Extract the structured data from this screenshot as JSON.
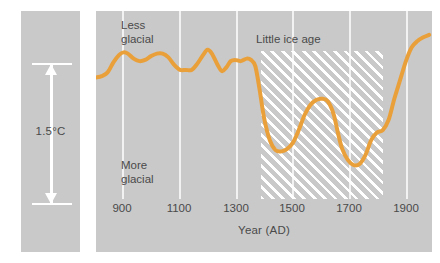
{
  "figure": {
    "background_color": "#ffffff",
    "panel_color": "#c9c9c9",
    "gridline_color": "#f2f2f2",
    "text_color": "#4a4a4a"
  },
  "scale": {
    "label": "1.5°C",
    "arrow_name": "vertical-scale-arrow",
    "arrow_color": "#ffffff"
  },
  "annotations": {
    "less_glacial": "Less\nglacial",
    "more_glacial": "More\nglacial",
    "little_ice_age": "Little ice age"
  },
  "axis": {
    "title": "Year (AD)",
    "ticks": [
      900,
      1100,
      1300,
      1500,
      1700,
      1900
    ],
    "tick_labels": [
      "900",
      "1100",
      "1300",
      "1500",
      "1700",
      "1900"
    ]
  },
  "chart_data": {
    "type": "line",
    "title": "",
    "subtitle": "",
    "xlabel": "Year (AD)",
    "ylabel": "",
    "xlim": [
      820,
      1980
    ],
    "ylim": [
      -1.05,
      0.45
    ],
    "grid": true,
    "legend": null,
    "line_color": "#e9a03b",
    "line_width_px": 4,
    "y_units": "relative temperature (°C), scale bar = 1.5°C",
    "y_direction_note": "up = Less glacial, down = More glacial",
    "shaded_region": {
      "label": "Little ice age",
      "x_start": 1390,
      "x_end": 1810,
      "fill": "white-diagonal-hatch"
    },
    "annotations": [
      {
        "text": "Less glacial",
        "x": 905,
        "y": 0.33
      },
      {
        "text": "More glacial",
        "x": 905,
        "y": -0.78
      },
      {
        "text": "Little ice age",
        "x": 1600,
        "y": 0.22
      }
    ],
    "x": [
      820,
      840,
      860,
      880,
      900,
      915,
      930,
      950,
      970,
      990,
      1010,
      1030,
      1050,
      1070,
      1090,
      1110,
      1130,
      1150,
      1170,
      1190,
      1205,
      1220,
      1240,
      1255,
      1270,
      1285,
      1300,
      1320,
      1340,
      1355,
      1370,
      1385,
      1400,
      1420,
      1440,
      1460,
      1480,
      1500,
      1520,
      1540,
      1560,
      1580,
      1600,
      1620,
      1640,
      1655,
      1670,
      1690,
      1710,
      1730,
      1750,
      1770,
      1790,
      1810,
      1830,
      1850,
      1870,
      1890,
      1910,
      1930,
      1950,
      1970
    ],
    "y": [
      -0.08,
      -0.07,
      -0.04,
      0.04,
      0.1,
      0.12,
      0.11,
      0.07,
      0.05,
      0.06,
      0.09,
      0.11,
      0.11,
      0.08,
      0.02,
      -0.02,
      -0.02,
      -0.02,
      0.03,
      0.1,
      0.14,
      0.11,
      0.02,
      -0.03,
      0.0,
      0.05,
      0.06,
      0.05,
      0.07,
      0.06,
      0.01,
      -0.18,
      -0.4,
      -0.58,
      -0.66,
      -0.67,
      -0.65,
      -0.6,
      -0.5,
      -0.38,
      -0.3,
      -0.26,
      -0.25,
      -0.27,
      -0.37,
      -0.52,
      -0.65,
      -0.74,
      -0.78,
      -0.77,
      -0.7,
      -0.58,
      -0.52,
      -0.5,
      -0.42,
      -0.25,
      -0.1,
      0.05,
      0.16,
      0.21,
      0.24,
      0.26
    ],
    "series": [
      {
        "name": "Glacial / temperature proxy",
        "color": "#e9a03b",
        "description": "Relative warmth curve showing medieval warm interval, sharp decline after 1350, two cold minima near 1450 and 1700, and modern warming after 1850."
      }
    ]
  }
}
